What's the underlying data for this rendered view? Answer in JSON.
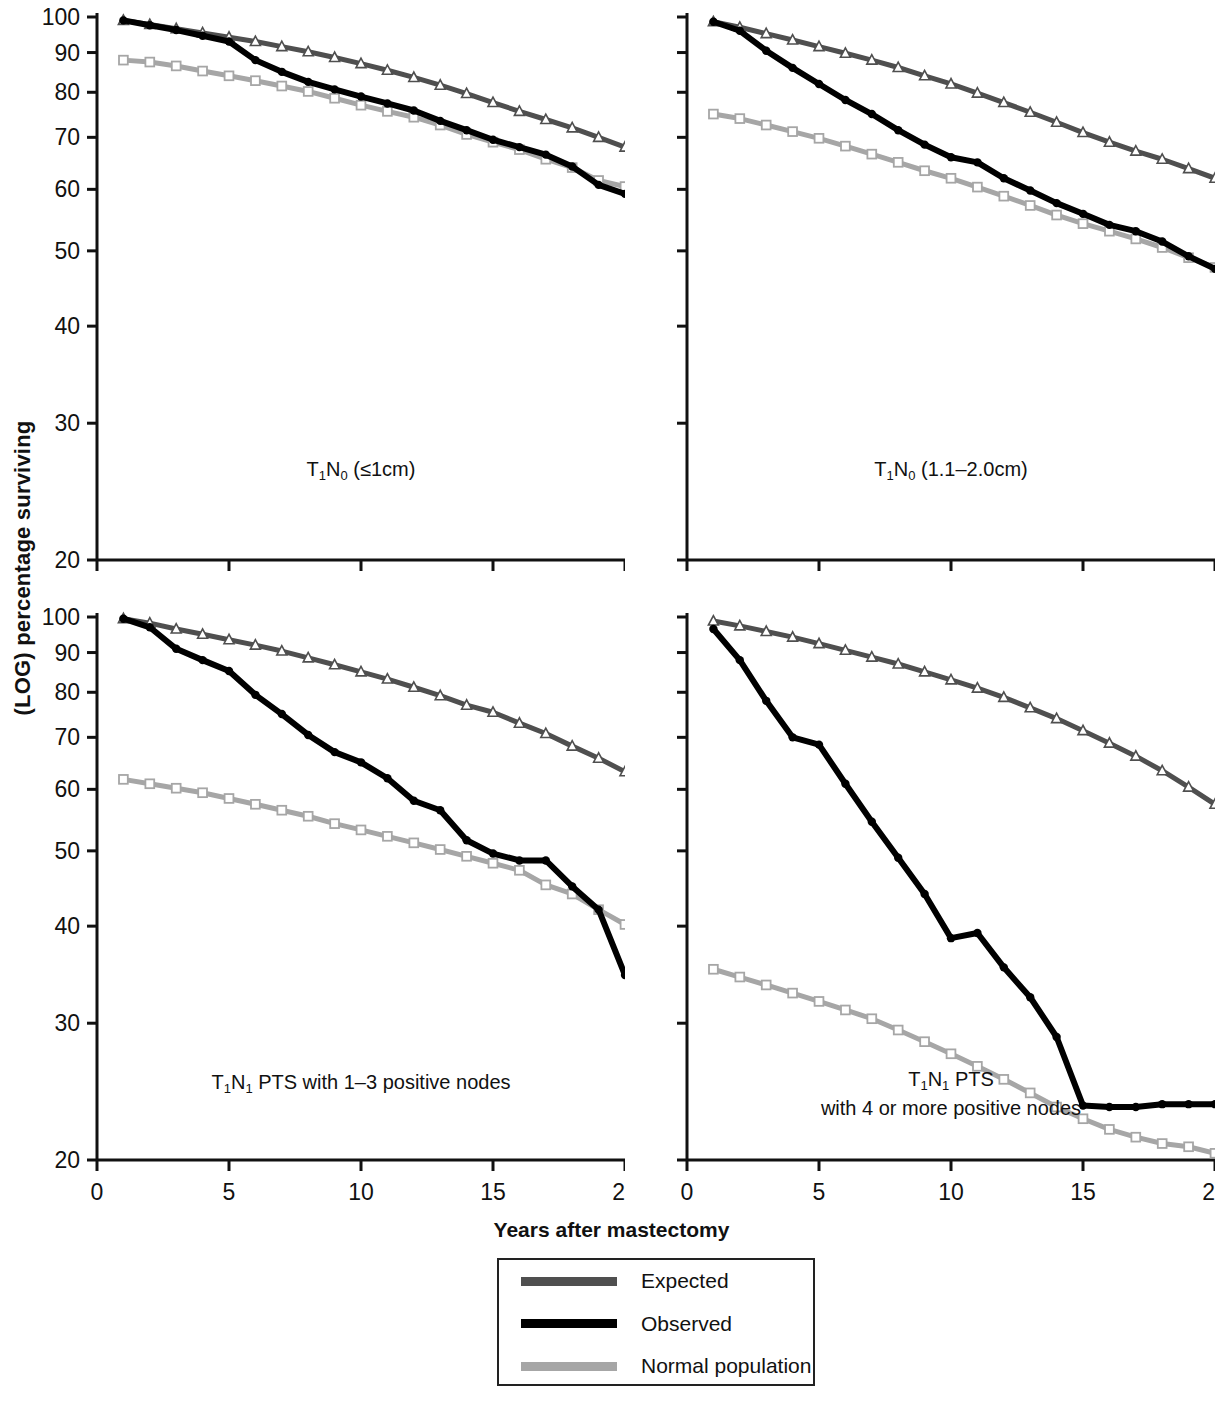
{
  "figure": {
    "ylabel": "(LOG) percentage surviving",
    "xlabel": "Years after mastectomy"
  },
  "legend": {
    "items": [
      {
        "label": "Expected",
        "color": "#4f4f4f"
      },
      {
        "label": "Observed",
        "color": "#000000"
      },
      {
        "label": "Normal population",
        "color": "#a6a6a6"
      }
    ]
  },
  "chart_data": [
    {
      "type": "line",
      "id": "panel-top-left",
      "title": "T1N0 (≤1cm)",
      "title_parts": {
        "pre": "T",
        "sub1": "1",
        "mid": "N",
        "sub2": "0",
        "post": " (≤1cm)"
      },
      "xlabel": "Years after mastectomy",
      "ylabel": "(LOG) percentage surviving",
      "yscale": "log",
      "ylim": [
        20,
        100
      ],
      "xlim": [
        0,
        20
      ],
      "yticks": [
        20,
        30,
        40,
        50,
        60,
        70,
        80,
        90,
        100
      ],
      "xticks": [
        0,
        5,
        10,
        15,
        20
      ],
      "grid": false,
      "x": [
        1,
        2,
        3,
        4,
        5,
        6,
        7,
        8,
        9,
        10,
        11,
        12,
        13,
        14,
        15,
        16,
        17,
        18,
        19,
        20
      ],
      "series": [
        {
          "name": "Expected",
          "color": "#4f4f4f",
          "marker": "triangle",
          "values": [
            99.0,
            97.8,
            96.6,
            95.4,
            94.2,
            93.0,
            91.6,
            90.2,
            88.7,
            87.1,
            85.4,
            83.6,
            81.7,
            79.7,
            77.6,
            75.6,
            73.8,
            72.0,
            70.0,
            68.0
          ]
        },
        {
          "name": "Observed",
          "color": "#000000",
          "marker": "circle",
          "values": [
            99.0,
            97.6,
            96.2,
            94.6,
            93.0,
            88.0,
            85.0,
            82.5,
            80.7,
            79.0,
            77.4,
            75.8,
            73.5,
            71.5,
            69.5,
            68.0,
            66.5,
            64.2,
            60.8,
            59.2
          ]
        },
        {
          "name": "Normal population",
          "color": "#a6a6a6",
          "marker": "square",
          "values": [
            88.0,
            87.5,
            86.5,
            85.2,
            84.0,
            82.8,
            81.5,
            80.2,
            78.6,
            77.0,
            75.6,
            74.3,
            72.6,
            70.6,
            69.0,
            67.5,
            65.6,
            64.0,
            61.6,
            60.5
          ]
        }
      ]
    },
    {
      "type": "line",
      "id": "panel-top-right",
      "title": "T1N0 (1.1–2.0cm)",
      "title_parts": {
        "pre": "T",
        "sub1": "1",
        "mid": "N",
        "sub2": "0",
        "post": " (1.1–2.0cm)"
      },
      "xlabel": "Years after mastectomy",
      "ylabel": "(LOG) percentage surviving",
      "yscale": "log",
      "ylim": [
        20,
        100
      ],
      "xlim": [
        0,
        20
      ],
      "yticks": [
        20,
        30,
        40,
        50,
        60,
        70,
        80,
        90,
        100
      ],
      "xticks": [
        0,
        5,
        10,
        15,
        20
      ],
      "grid": false,
      "x": [
        1,
        2,
        3,
        4,
        5,
        6,
        7,
        8,
        9,
        10,
        11,
        12,
        13,
        14,
        15,
        16,
        17,
        18,
        19,
        20
      ],
      "series": [
        {
          "name": "Expected",
          "color": "#4f4f4f",
          "marker": "triangle",
          "values": [
            98.6,
            97.0,
            95.2,
            93.4,
            91.6,
            89.8,
            88.0,
            86.1,
            84.0,
            82.0,
            79.8,
            77.6,
            75.4,
            73.2,
            71.0,
            69.0,
            67.2,
            65.6,
            63.8,
            62.0
          ]
        },
        {
          "name": "Observed",
          "color": "#000000",
          "marker": "circle",
          "values": [
            98.6,
            96.0,
            90.5,
            86.0,
            82.0,
            78.2,
            75.0,
            71.5,
            68.5,
            66.0,
            65.0,
            62.0,
            59.8,
            57.6,
            55.8,
            54.0,
            53.0,
            51.4,
            49.2,
            47.4
          ]
        },
        {
          "name": "Normal population",
          "color": "#a6a6a6",
          "marker": "square",
          "values": [
            75.0,
            74.0,
            72.6,
            71.2,
            69.8,
            68.2,
            66.6,
            65.0,
            63.4,
            62.0,
            60.4,
            58.8,
            57.2,
            55.6,
            54.2,
            53.0,
            51.8,
            50.5,
            49.0,
            47.6
          ]
        }
      ]
    },
    {
      "type": "line",
      "id": "panel-bottom-left",
      "title": "T1N1 PTS with 1–3 positive nodes",
      "title_parts": {
        "pre": "T",
        "sub1": "1",
        "mid": "N",
        "sub2": "1",
        "post": " PTS with 1–3 positive nodes"
      },
      "xlabel": "Years after mastectomy",
      "ylabel": "(LOG) percentage surviving",
      "yscale": "log",
      "ylim": [
        20,
        100
      ],
      "xlim": [
        0,
        20
      ],
      "yticks": [
        20,
        30,
        40,
        50,
        60,
        70,
        80,
        90,
        100
      ],
      "xticks": [
        0,
        5,
        10,
        15,
        20
      ],
      "grid": false,
      "x": [
        1,
        2,
        3,
        4,
        5,
        6,
        7,
        8,
        9,
        10,
        11,
        12,
        13,
        14,
        15,
        16,
        17,
        18,
        19,
        20
      ],
      "series": [
        {
          "name": "Expected",
          "color": "#4f4f4f",
          "marker": "triangle",
          "values": [
            99.5,
            98.2,
            96.5,
            95.0,
            93.5,
            92.0,
            90.4,
            88.6,
            86.8,
            85.0,
            83.2,
            81.2,
            79.2,
            77.0,
            75.4,
            73.0,
            70.8,
            68.2,
            65.8,
            63.2
          ]
        },
        {
          "name": "Observed",
          "color": "#000000",
          "marker": "circle",
          "values": [
            99.5,
            97.0,
            91.0,
            88.0,
            85.2,
            79.4,
            75.0,
            70.5,
            67.0,
            65.0,
            62.0,
            58.0,
            56.4,
            51.6,
            49.6,
            48.6,
            48.6,
            45.0,
            42.0,
            34.6
          ]
        },
        {
          "name": "Normal population",
          "color": "#a6a6a6",
          "marker": "square",
          "values": [
            61.8,
            61.0,
            60.2,
            59.4,
            58.4,
            57.4,
            56.4,
            55.4,
            54.2,
            53.2,
            52.2,
            51.2,
            50.2,
            49.2,
            48.2,
            47.2,
            45.2,
            44.0,
            42.0,
            40.2
          ]
        }
      ]
    },
    {
      "type": "line",
      "id": "panel-bottom-right",
      "title": "T1N1 PTS with 4 or more positive nodes",
      "title_parts": {
        "pre": "T",
        "sub1": "1",
        "mid": "N",
        "sub2": "1",
        "post": " PTS"
      },
      "title_line2": "with 4 or more positive nodes",
      "xlabel": "Years after mastectomy",
      "ylabel": "(LOG) percentage surviving",
      "yscale": "log",
      "ylim": [
        20,
        100
      ],
      "xlim": [
        0,
        20
      ],
      "yticks": [
        20,
        30,
        40,
        50,
        60,
        70,
        80,
        90,
        100
      ],
      "xticks": [
        0,
        5,
        10,
        15,
        20
      ],
      "grid": false,
      "x": [
        1,
        2,
        3,
        4,
        5,
        6,
        7,
        8,
        9,
        10,
        11,
        12,
        13,
        14,
        15,
        16,
        17,
        18,
        19,
        20
      ],
      "series": [
        {
          "name": "Expected",
          "color": "#4f4f4f",
          "marker": "triangle",
          "values": [
            98.8,
            97.4,
            95.8,
            94.2,
            92.4,
            90.6,
            88.8,
            87.0,
            85.0,
            83.0,
            81.0,
            78.8,
            76.4,
            74.0,
            71.4,
            68.8,
            66.2,
            63.4,
            60.4,
            57.4
          ]
        },
        {
          "name": "Observed",
          "color": "#000000",
          "marker": "circle",
          "values": [
            96.5,
            88.0,
            78.0,
            70.0,
            68.5,
            61.0,
            54.5,
            49.0,
            44.0,
            38.6,
            39.2,
            35.4,
            32.4,
            28.8,
            23.5,
            23.4,
            23.4,
            23.6,
            23.6,
            23.6
          ]
        },
        {
          "name": "Normal population",
          "color": "#a6a6a6",
          "marker": "square",
          "values": [
            35.2,
            34.4,
            33.6,
            32.8,
            32.0,
            31.2,
            30.4,
            29.4,
            28.4,
            27.4,
            26.4,
            25.4,
            24.4,
            23.4,
            22.6,
            21.9,
            21.4,
            21.0,
            20.8,
            20.4
          ]
        }
      ]
    }
  ]
}
